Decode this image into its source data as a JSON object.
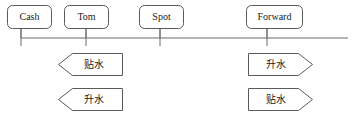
{
  "diagram": {
    "type": "timeline",
    "width": 353,
    "height": 119,
    "colors": {
      "background": "#ffffff",
      "stroke": "#5a5a5a",
      "axis": "#6b6b6b",
      "text": "#1a1a1a"
    },
    "axis": {
      "y": 38,
      "x_start": 21,
      "x_end": 348,
      "tick_top": 29,
      "tick_bottom": 46
    },
    "nodes": [
      {
        "id": "cash",
        "label": "Cash",
        "box": {
          "x": 7,
          "y": 5,
          "width": 44,
          "height": 23,
          "radius": 5
        },
        "tick_x": 21,
        "stem": {
          "x": 21,
          "y_top": 28,
          "y_bottom": 38
        }
      },
      {
        "id": "tom",
        "label": "Tom",
        "box": {
          "x": 64,
          "y": 5,
          "width": 44,
          "height": 23,
          "radius": 5
        },
        "tick_x": 86,
        "stem": {
          "x": 86,
          "y_top": 28,
          "y_bottom": 38
        }
      },
      {
        "id": "spot",
        "label": "Spot",
        "box": {
          "x": 139,
          "y": 5,
          "width": 44,
          "height": 23,
          "radius": 5
        },
        "tick_x": 160,
        "stem": {
          "x": 160,
          "y_top": 28,
          "y_bottom": 38
        }
      },
      {
        "id": "forward",
        "label": "Forward",
        "box": {
          "x": 246,
          "y": 5,
          "width": 56,
          "height": 23,
          "radius": 5
        },
        "tick_x": 267,
        "stem": {
          "x": 267,
          "y_top": 28,
          "y_bottom": 38
        }
      }
    ],
    "banners": [
      {
        "id": "left-discount",
        "label": "贴水",
        "direction": "left",
        "tip_x": 58,
        "base_x": 122,
        "y_top": 53,
        "y_bottom": 75,
        "notch": 14,
        "label_x": 94,
        "label_y": 64
      },
      {
        "id": "left-premium",
        "label": "升水",
        "direction": "left",
        "tip_x": 58,
        "base_x": 122,
        "y_top": 88,
        "y_bottom": 110,
        "notch": 14,
        "label_x": 94,
        "label_y": 99
      },
      {
        "id": "right-premium",
        "label": "升水",
        "direction": "right",
        "tip_x": 312,
        "base_x": 248,
        "y_top": 53,
        "y_bottom": 75,
        "notch": 14,
        "label_x": 276,
        "label_y": 64
      },
      {
        "id": "right-discount",
        "label": "贴水",
        "direction": "right",
        "tip_x": 312,
        "base_x": 248,
        "y_top": 88,
        "y_bottom": 110,
        "notch": 14,
        "label_x": 276,
        "label_y": 99
      }
    ]
  }
}
